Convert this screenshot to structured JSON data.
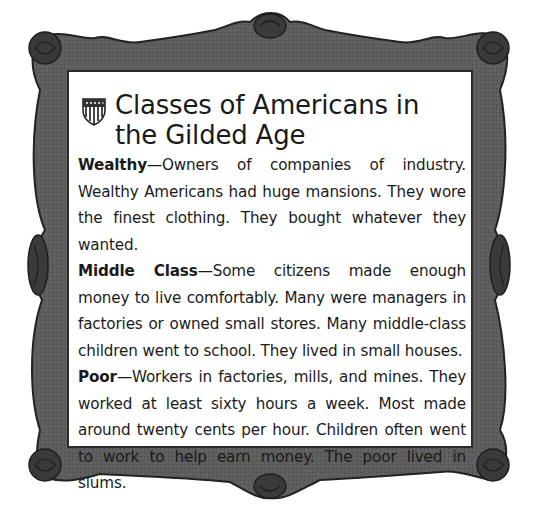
{
  "card": {
    "title": "Classes of Americans in the Gilded Age",
    "icon": "shield-icon",
    "frame_color": "#4a4a4a",
    "entries": [
      {
        "term": "Wealthy",
        "dash": "—",
        "description": "Owners of companies of industry. Wealthy Americans had huge mansions. They wore the finest clothing. They bought whatever they wanted."
      },
      {
        "term": "Middle Class",
        "dash": "—",
        "description": "Some citizens made enough money to live comfortably. Many were managers in factories or owned small stores. Many middle-class children went to school. They lived in small houses."
      },
      {
        "term": "Poor",
        "dash": "—",
        "description": "Workers in factories, mills, and mines. They worked at least sixty hours a week. Most made around twenty cents per hour. Children often went to work to help earn money. The poor lived in slums."
      }
    ]
  }
}
